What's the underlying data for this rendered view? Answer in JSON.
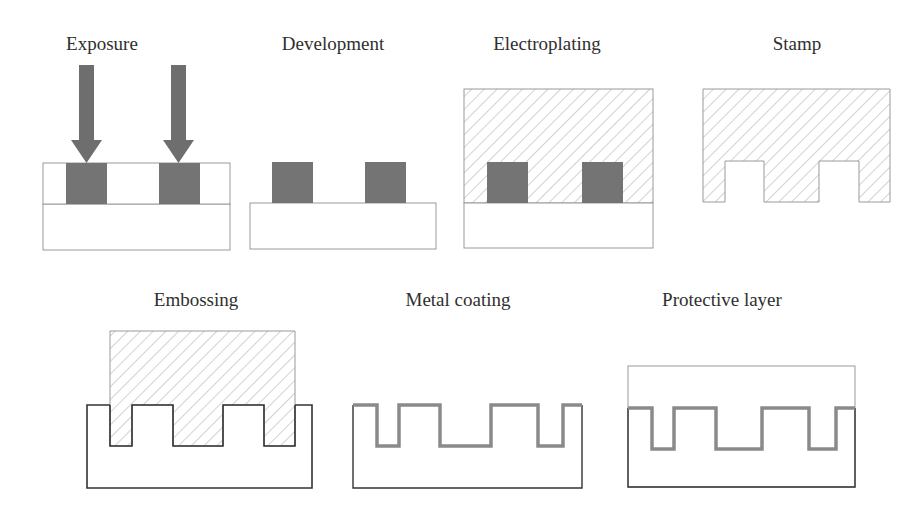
{
  "figure": {
    "colors": {
      "background": "#ffffff",
      "outline_light": "#9a9a9a",
      "outline_dark": "#333333",
      "resist_block": "#747474",
      "arrow": "#6e6e6e",
      "hatch": "#b3b3b3",
      "metal_coating": "#8a8a8a",
      "label_text": "#2f2f2f"
    },
    "steps": [
      {
        "id": "exposure",
        "label": "Exposure",
        "label_x": 102,
        "label_y": 34
      },
      {
        "id": "development",
        "label": "Development",
        "label_x": 333,
        "label_y": 34
      },
      {
        "id": "electroplating",
        "label": "Electroplating",
        "label_x": 547,
        "label_y": 34
      },
      {
        "id": "stamp",
        "label": "Stamp",
        "label_x": 797,
        "label_y": 34
      },
      {
        "id": "embossing",
        "label": "Embossing",
        "label_x": 196,
        "label_y": 290
      },
      {
        "id": "metal-coating",
        "label": "Metal coating",
        "label_x": 458,
        "label_y": 290
      },
      {
        "id": "protective-layer",
        "label": "Protective layer",
        "label_x": 722,
        "label_y": 290
      }
    ]
  }
}
